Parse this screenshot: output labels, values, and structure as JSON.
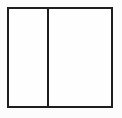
{
  "figure": {
    "background_color": "#fcfcfc",
    "line_color": "#1e1e1e",
    "line_thickness_px": 2,
    "outer_rect": {
      "x": 7,
      "y": 7,
      "width": 106,
      "height": 101
    },
    "divider_x_from_rect_left": 38,
    "panels": [
      {
        "name": "left-panel",
        "relative_width_fraction": 0.36,
        "content": ""
      },
      {
        "name": "right-panel",
        "relative_width_fraction": 0.64,
        "content": ""
      }
    ]
  }
}
